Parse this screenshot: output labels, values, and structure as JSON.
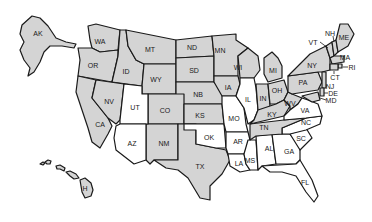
{
  "map": {
    "title": "United States",
    "colors": {
      "shaded": "#d4d4d4",
      "unshaded": "#ffffff",
      "border": "#1a1a1a"
    },
    "states": [
      {
        "abbr": "AK",
        "shaded": true,
        "label_xy": [
          38,
          33
        ],
        "points": "22,25 32,16 40,18 48,26 56,38 66,42 76,44 74,48 62,46 50,46 44,52 40,62 34,72 28,76 30,68 24,60 20,50 24,42 20,34"
      },
      {
        "abbr": "WA",
        "shaded": true,
        "label_xy": [
          100,
          41
        ],
        "points": "88,26 96,24 120,30 118,50 100,52 92,48 90,40"
      },
      {
        "abbr": "OR",
        "shaded": true,
        "label_xy": [
          93,
          65
        ],
        "points": "78,48 92,48 100,52 118,50 118,56 112,82 78,76 80,60"
      },
      {
        "abbr": "ID",
        "shaded": true,
        "label_xy": [
          126,
          71
        ],
        "points": "120,30 126,30 128,46 136,60 144,64 142,86 112,82 118,56"
      },
      {
        "abbr": "MT",
        "shaded": true,
        "label_xy": [
          150,
          49
        ],
        "points": "126,30 176,40 176,64 144,64 136,60 128,46"
      },
      {
        "abbr": "WY",
        "shaded": true,
        "label_xy": [
          156,
          79
        ],
        "points": "144,64 176,64 176,94 142,94 142,86"
      },
      {
        "abbr": "ND",
        "shaded": true,
        "label_xy": [
          192,
          47
        ],
        "points": "176,40 212,36 214,56 176,58"
      },
      {
        "abbr": "SD",
        "shaded": true,
        "label_xy": [
          194,
          70
        ],
        "points": "176,58 214,56 214,82 176,82"
      },
      {
        "abbr": "NB",
        "shaded": true,
        "label_xy": [
          198,
          94
        ],
        "points": "176,82 214,82 222,90 228,104 176,104 176,94"
      },
      {
        "abbr": "MN",
        "shaded": true,
        "label_xy": [
          220,
          50
        ],
        "points": "212,36 236,34 236,40 248,48 238,56 238,76 214,76 214,56"
      },
      {
        "abbr": "IA",
        "shaded": true,
        "label_xy": [
          228,
          87
        ],
        "points": "214,76 238,76 240,84 236,96 222,96 214,82"
      },
      {
        "abbr": "WI",
        "shaded": true,
        "label_xy": [
          238,
          67
        ],
        "points": "238,56 248,48 258,56 260,70 254,78 240,78"
      },
      {
        "abbr": "CO",
        "shaded": true,
        "label_xy": [
          165,
          110
        ],
        "points": "148,94 184,94 184,124 148,124"
      },
      {
        "abbr": "KS",
        "shaded": true,
        "label_xy": [
          200,
          115
        ],
        "points": "184,104 222,104 224,124 184,124"
      },
      {
        "abbr": "NM",
        "shaded": true,
        "label_xy": [
          164,
          143
        ],
        "points": "146,124 178,124 178,160 154,160 150,164 146,160"
      },
      {
        "abbr": "TX",
        "shaded": true,
        "label_xy": [
          200,
          166
        ],
        "points": "178,124 196,124 196,144 216,148 226,150 230,160 222,174 210,186 210,200 200,198 188,178 178,170 166,168 154,160 178,160"
      },
      {
        "abbr": "CA",
        "shaded": true,
        "label_xy": [
          100,
          124
        ],
        "points": "78,76 96,80 92,98 108,118 112,126 108,134 100,148 92,142 88,128 82,110 76,92"
      },
      {
        "abbr": "NV",
        "shaded": true,
        "label_xy": [
          109,
          101
        ],
        "points": "96,80 124,84 120,120 116,124 108,118 92,98"
      },
      {
        "abbr": "UT",
        "shaded": false,
        "label_xy": [
          135,
          107
        ],
        "points": "124,84 142,86 142,94 148,94 148,124 120,124 120,120"
      },
      {
        "abbr": "AZ",
        "shaded": false,
        "label_xy": [
          132,
          143
        ],
        "points": "120,124 146,124 146,160 134,164 116,150 114,138 116,126"
      },
      {
        "abbr": "OK",
        "shaded": false,
        "label_xy": [
          209,
          137
        ],
        "points": "184,124 224,124 226,148 216,148 196,144 196,130 184,130"
      },
      {
        "abbr": "MO",
        "shaded": false,
        "label_xy": [
          234,
          118
        ],
        "points": "222,96 236,96 244,108 246,124 248,132 226,132 224,124 222,104"
      },
      {
        "abbr": "AR",
        "shaded": false,
        "label_xy": [
          238,
          141
        ],
        "points": "226,132 248,132 250,140 244,154 228,154 226,148"
      },
      {
        "abbr": "LA",
        "shaded": false,
        "label_xy": [
          239,
          163
        ],
        "points": "228,154 244,154 246,164 250,170 240,172 230,166"
      },
      {
        "abbr": "MS",
        "shaded": false,
        "label_xy": [
          250,
          160
        ],
        "points": "248,140 256,140 258,170 250,170 246,164 244,154"
      },
      {
        "abbr": "AL",
        "shaded": false,
        "label_xy": [
          269,
          148
        ],
        "points": "256,136 272,134 276,164 262,166 258,170"
      },
      {
        "abbr": "GA",
        "shaded": false,
        "label_xy": [
          289,
          151
        ],
        "points": "272,134 290,134 300,146 300,160 296,164 276,164"
      },
      {
        "abbr": "FL",
        "shaded": false,
        "label_xy": [
          305,
          182
        ],
        "points": "262,166 296,164 300,160 312,180 318,196 314,202 306,192 296,176 282,172 270,172"
      },
      {
        "abbr": "SC",
        "shaded": false,
        "label_xy": [
          301,
          138
        ],
        "points": "290,134 306,128 312,138 300,150"
      },
      {
        "abbr": "NC",
        "shaded": false,
        "label_xy": [
          306,
          122
        ],
        "points": "282,128 306,118 322,116 320,124 306,130 290,134 282,134"
      },
      {
        "abbr": "TN",
        "shaded": true,
        "label_xy": [
          264,
          127
        ],
        "points": "250,124 284,120 306,118 282,128 282,134 256,136 250,140"
      },
      {
        "abbr": "IL",
        "shaded": false,
        "label_xy": [
          248,
          99
        ],
        "points": "240,78 254,78 256,88 258,110 254,120 248,124 244,108 236,96 240,84"
      },
      {
        "abbr": "IN",
        "shaded": true,
        "label_xy": [
          263,
          98
        ],
        "points": "256,84 268,84 270,106 262,112 258,110"
      },
      {
        "abbr": "OH",
        "shaded": true,
        "label_xy": [
          277,
          90
        ],
        "points": "268,84 284,80 288,92 284,100 276,104 270,104"
      },
      {
        "abbr": "KY",
        "shaded": true,
        "label_xy": [
          272,
          114
        ],
        "points": "258,110 270,106 276,104 284,100 290,106 284,116 250,124 254,120"
      },
      {
        "abbr": "WV",
        "shaded": true,
        "label_xy": [
          290,
          103
        ],
        "points": "284,100 288,92 292,94 302,98 298,104 290,110 290,106"
      },
      {
        "abbr": "VA",
        "shaded": false,
        "label_xy": [
          305,
          110
        ],
        "points": "290,110 298,104 302,98 308,100 318,104 322,116 306,118 284,120 284,116"
      },
      {
        "abbr": "MI",
        "shaded": true,
        "label_xy": [
          273,
          70
        ],
        "points": "264,58 272,52 278,58 282,66 282,78 268,82 264,74"
      },
      {
        "abbr": "PA",
        "shaded": true,
        "label_xy": [
          303,
          82
        ],
        "points": "288,76 318,72 322,82 318,90 292,94 288,92"
      },
      {
        "abbr": "NY",
        "shaded": true,
        "label_xy": [
          312,
          65
        ],
        "points": "288,76 300,64 310,54 326,46 330,58 330,70 322,72 318,72"
      },
      {
        "abbr": "VT",
        "shaded": true,
        "label_xy": [
          326,
          48
        ],
        "points": "326,46 332,42 334,56 330,58"
      },
      {
        "abbr": "NH",
        "shaded": true,
        "label_xy": [
          334,
          46
        ],
        "points": "332,42 336,40 338,52 334,56"
      },
      {
        "abbr": "ME",
        "shaded": true,
        "label_xy": [
          344,
          37
        ],
        "points": "336,40 340,24 348,24 354,34 348,46 338,52"
      },
      {
        "abbr": "MA",
        "shaded": true,
        "label_xy": [
          338,
          60
        ],
        "points": "330,58 334,56 344,56 344,62 332,64"
      },
      {
        "abbr": "RI",
        "shaded": true,
        "label_xy": [
          340,
          66
        ],
        "points": "338,64 342,64 342,68 338,68"
      },
      {
        "abbr": "CT",
        "shaded": true,
        "label_xy": [
          333,
          68
        ],
        "points": "330,64 338,64 338,70 330,70"
      },
      {
        "abbr": "NJ",
        "shaded": true,
        "label_xy": [
          324,
          82
        ],
        "points": "322,72 326,72 326,88 322,88"
      },
      {
        "abbr": "DE",
        "shaded": true,
        "label_xy": [
          323,
          92
        ],
        "points": "320,88 324,88 324,96 320,96"
      },
      {
        "abbr": "MD",
        "shaded": true,
        "label_xy": [
          318,
          97
        ],
        "points": "302,96 318,92 320,100 312,102"
      }
    ],
    "hawaii": {
      "abbr": "H",
      "shaded": true,
      "label_xy": [
        56,
        183
      ]
    },
    "callouts": [
      {
        "abbr": "VT",
        "text_xy": [
          313,
          42
        ],
        "line": [
          [
            320,
            42
          ],
          [
            328,
            48
          ]
        ]
      },
      {
        "abbr": "NH",
        "text_xy": [
          330,
          33
        ],
        "line": [
          [
            333,
            36
          ],
          [
            334,
            42
          ]
        ]
      },
      {
        "abbr": "MA",
        "text_xy": [
          345,
          57
        ],
        "line": [
          [
            340,
            59
          ],
          [
            340,
            59
          ]
        ]
      },
      {
        "abbr": "RI",
        "text_xy": [
          352,
          67
        ],
        "line": [
          [
            343,
            67
          ],
          [
            348,
            67
          ]
        ]
      },
      {
        "abbr": "CT",
        "text_xy": [
          335,
          77
        ],
        "line": [
          [
            334,
            71
          ],
          [
            334,
            74
          ]
        ]
      },
      {
        "abbr": "NJ",
        "text_xy": [
          330,
          86
        ],
        "line": [
          [
            326,
            86
          ],
          [
            327,
            86
          ]
        ]
      },
      {
        "abbr": "DE",
        "text_xy": [
          333,
          93
        ],
        "line": [
          [
            324,
            93
          ],
          [
            328,
            93
          ]
        ]
      },
      {
        "abbr": "MD",
        "text_xy": [
          331,
          100
        ],
        "line": [
          [
            320,
            98
          ],
          [
            326,
            100
          ]
        ]
      }
    ]
  }
}
